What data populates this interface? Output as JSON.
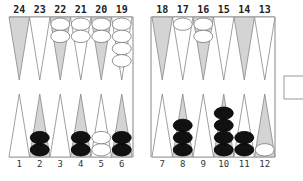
{
  "board": {
    "top_numbers_left": [
      "24",
      "23",
      "22",
      "21",
      "20",
      "19"
    ],
    "top_numbers_right": [
      "18",
      "17",
      "16",
      "15",
      "14",
      "13"
    ],
    "bottom_numbers_left": [
      "1",
      "2",
      "3",
      "4",
      "5",
      "6"
    ],
    "bottom_numbers_right": [
      "7",
      "8",
      "9",
      "10",
      "11",
      "12"
    ],
    "colors": {
      "shaded_point": "#d4d4d4",
      "plain_point": "#ffffff",
      "outline": "#888888",
      "black_checker": "#111111",
      "white_checker": "#ffffff"
    },
    "checkers": {
      "white": [
        {
          "point": 22,
          "count": 2
        },
        {
          "point": 21,
          "count": 2
        },
        {
          "point": 20,
          "count": 2
        },
        {
          "point": 19,
          "count": 4
        },
        {
          "point": 17,
          "count": 1
        },
        {
          "point": 16,
          "count": 2
        },
        {
          "point": 5,
          "count": 2
        },
        {
          "point": 12,
          "count": 1
        }
      ],
      "black": [
        {
          "point": 2,
          "count": 2
        },
        {
          "point": 4,
          "count": 2
        },
        {
          "point": 6,
          "count": 2
        },
        {
          "point": 8,
          "count": 3
        },
        {
          "point": 10,
          "count": 4
        },
        {
          "point": 11,
          "count": 2
        }
      ]
    }
  },
  "doubling_cube_box": {
    "label": ""
  }
}
